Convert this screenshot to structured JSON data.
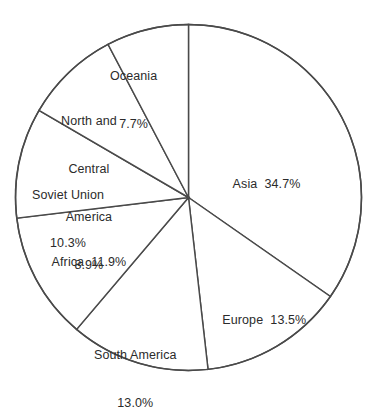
{
  "chart_data": {
    "type": "pie",
    "title": "",
    "subtitle": "",
    "xlabel": "",
    "ylabel": "",
    "legend_position": "none",
    "grid": false,
    "labels_inside_slices": true,
    "start_angle_deg": 0,
    "direction": "clockwise",
    "unit": "%",
    "categories": [
      "Asia",
      "Europe",
      "South America",
      "Africa",
      "Soviet Union",
      "North and Central America",
      "Oceania"
    ],
    "values": [
      34.7,
      13.5,
      13.0,
      11.9,
      10.3,
      8.9,
      7.7
    ],
    "slices": [
      {
        "name": "Asia",
        "value": 34.7,
        "value_text": "34.7%",
        "label_lines": [
          "Asia  34.7%"
        ]
      },
      {
        "name": "Europe",
        "value": 13.5,
        "value_text": "13.5%",
        "label_lines": [
          "Europe  13.5%"
        ]
      },
      {
        "name": "South America",
        "value": 13.0,
        "value_text": "13.0%",
        "label_lines": [
          "South America",
          "13.0%"
        ]
      },
      {
        "name": "Africa",
        "value": 11.9,
        "value_text": "11.9%",
        "label_lines": [
          "Africa  11.9%"
        ]
      },
      {
        "name": "Soviet Union",
        "value": 10.3,
        "value_text": "10.3%",
        "label_lines": [
          "Soviet Union",
          "10.3%"
        ]
      },
      {
        "name": "North and Central America",
        "value": 8.9,
        "value_text": "8.9%",
        "label_lines": [
          "North and",
          "Central",
          "America",
          "8.9%"
        ]
      },
      {
        "name": "Oceania",
        "value": 7.7,
        "value_text": "7.7%",
        "label_lines": [
          "Oceania",
          "7.7%"
        ]
      }
    ],
    "colors": {
      "slice_fill": "#ffffff",
      "slice_stroke": "#4a4a4a",
      "label_text": "#2b2b2b",
      "background": "#ffffff"
    }
  },
  "labels": {
    "asia": {
      "line1": "Asia  34.7%"
    },
    "europe": {
      "line1": "Europe  13.5%"
    },
    "south": {
      "line1": "South America",
      "line2": "13.0%"
    },
    "africa": {
      "line1": "Africa  11.9%"
    },
    "soviet": {
      "line1": "Soviet Union",
      "line2": "10.3%"
    },
    "northcent": {
      "line1": "North and",
      "line2": "Central",
      "line3": "America",
      "line4": "8.9%"
    },
    "oceania": {
      "line1": "Oceania",
      "line2": "7.7%"
    }
  }
}
